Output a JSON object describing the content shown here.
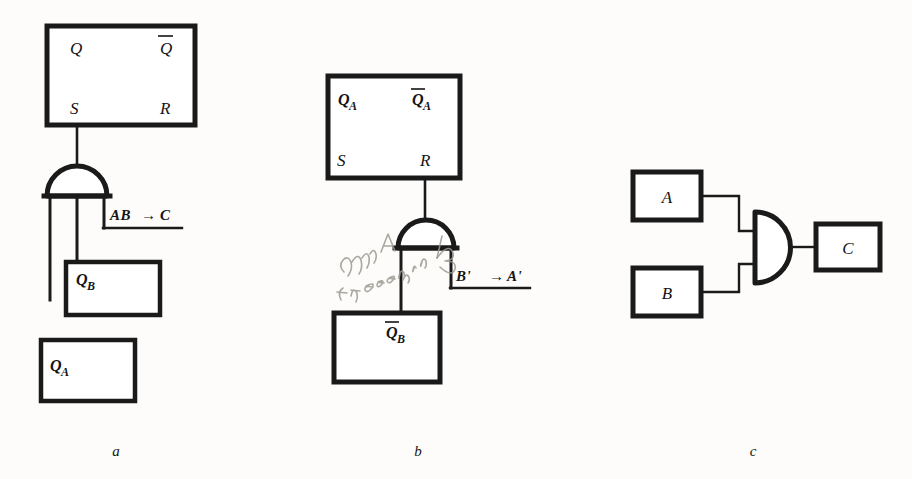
{
  "figure": {
    "background_color": "#fdfcfa",
    "ink_color": "#1a1a1a",
    "pencil_color": "#9a9a90"
  },
  "panels": [
    {
      "id": "a",
      "caption": "a",
      "flipflop": {
        "name": "sr-flip-flop",
        "terminals": {
          "q": "Q",
          "q_not": "Q",
          "q_not_overbar": true,
          "s": "S",
          "r": "R"
        }
      },
      "gate": {
        "name": "and-gate-dome",
        "type": "AND",
        "inputs": 3
      },
      "output_label": "AB",
      "output_arrow": "→",
      "output_target": "C",
      "boxes": [
        {
          "label": "Q",
          "subscript": "B",
          "overbar": false
        },
        {
          "label": "Q",
          "subscript": "A",
          "overbar": false
        }
      ]
    },
    {
      "id": "b",
      "caption": "b",
      "flipflop": {
        "name": "sr-flip-flop",
        "terminals": {
          "q": "Q",
          "q_subscript": "A",
          "q_not": "Q",
          "q_not_subscript": "A",
          "q_not_overbar": true,
          "s": "S",
          "r": "R"
        }
      },
      "gate": {
        "name": "and-gate-dome",
        "type": "AND",
        "inputs": 2
      },
      "output_label": "B'",
      "output_arrow": "→",
      "output_target": "A'",
      "boxes": [
        {
          "label": "Q",
          "subscript": "B",
          "overbar": true
        }
      ],
      "annotation": {
        "name": "pencil-annotation",
        "text": "clear A if zero in B",
        "style": "handwritten-pencil"
      }
    },
    {
      "id": "c",
      "caption": "c",
      "gate": {
        "name": "and-gate-d-shape",
        "type": "AND",
        "inputs": 2
      },
      "boxes": [
        {
          "label": "A",
          "role": "input-top"
        },
        {
          "label": "B",
          "role": "input-bottom"
        },
        {
          "label": "C",
          "role": "output"
        }
      ]
    }
  ]
}
